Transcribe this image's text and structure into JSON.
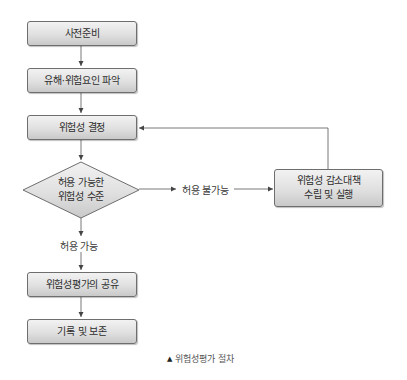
{
  "diagram": {
    "type": "flowchart",
    "nodes": {
      "prepare": {
        "label": "사전준비"
      },
      "identify": {
        "label": "유해·위험요인 파악"
      },
      "determine": {
        "label": "위험성 결정"
      },
      "decision": {
        "line1": "허용 가능한",
        "line2": "위험성 수준"
      },
      "reduce": {
        "line1": "위험성 감소대책",
        "line2": "수립 및 실행"
      },
      "share": {
        "label": "위험성평가의 공유"
      },
      "record": {
        "label": "기록 및 보존"
      }
    },
    "edges": {
      "not_acceptable": "허용 불가능",
      "acceptable": "허용 가능"
    },
    "caption": {
      "marker": "▲",
      "text": "위험성평가 절차"
    },
    "colors": {
      "box_top": "#f2f2f2",
      "box_bottom": "#c9c9c9",
      "border": "#6e6e6e",
      "line": "#555555"
    }
  }
}
